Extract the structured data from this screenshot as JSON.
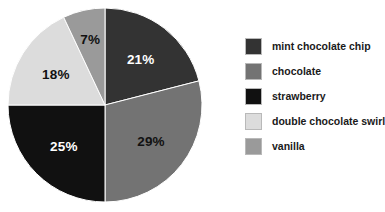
{
  "chart_data": {
    "type": "pie",
    "title": "",
    "categories": [
      "mint chocolate chip",
      "chocolate",
      "strawberry",
      "double chocolate swirl",
      "vanilla"
    ],
    "values": [
      21,
      29,
      25,
      18,
      7
    ],
    "value_labels": [
      "21%",
      "29%",
      "25%",
      "18%",
      "7%"
    ],
    "colors": [
      "#333333",
      "#737373",
      "#111111",
      "#dcdcdc",
      "#9a9a9a"
    ],
    "label_colors": [
      "#ffffff",
      "#111111",
      "#ffffff",
      "#111111",
      "#111111"
    ],
    "start_angle_deg": 0,
    "direction": "clockwise",
    "legend_position": "right",
    "grid": false
  },
  "legend": {
    "items": [
      {
        "label": "mint chocolate chip",
        "color": "#333333"
      },
      {
        "label": "chocolate",
        "color": "#737373"
      },
      {
        "label": "strawberry",
        "color": "#111111"
      },
      {
        "label": "double chocolate swirl",
        "color": "#dcdcdc"
      },
      {
        "label": "vanilla",
        "color": "#9a9a9a"
      }
    ]
  },
  "slices": [
    {
      "name": "mint chocolate chip",
      "percent_label": "21%"
    },
    {
      "name": "chocolate",
      "percent_label": "29%"
    },
    {
      "name": "strawberry",
      "percent_label": "25%"
    },
    {
      "name": "double chocolate swirl",
      "percent_label": "18%"
    },
    {
      "name": "vanilla",
      "percent_label": "7%"
    }
  ]
}
